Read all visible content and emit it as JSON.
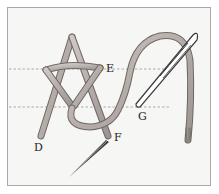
{
  "diagram": {
    "labels": {
      "D": "D",
      "E": "E",
      "F": "F",
      "G": "G"
    },
    "colors": {
      "background": "#ffffff",
      "panel": "#f6f6f4",
      "frame": "#a8a8a8",
      "thread_fill": "#b9b2ae",
      "thread_edge": "#6f6763",
      "needle": "#3a3a3a",
      "guide_line": "#9a9a9a"
    },
    "guide_lines": [
      "upper-guide-line",
      "lower-guide-line"
    ]
  }
}
